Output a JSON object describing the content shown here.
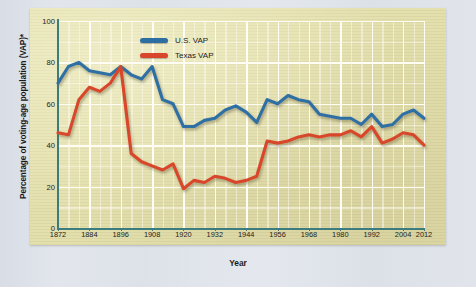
{
  "figure": {
    "panel_color": "#e3dfab",
    "background_color": "#dfe3ea",
    "axis_color": "#3d7c7c",
    "grid_color": "#fdfaf0"
  },
  "legend": {
    "position": "top-center",
    "entries": [
      {
        "label": "U.S. VAP",
        "color": "#2d6fa3"
      },
      {
        "label": "Texas VAP",
        "color": "#d9462c"
      }
    ]
  },
  "chart_data": {
    "type": "line",
    "title": "",
    "subtitle": "",
    "xlabel": "Year",
    "ylabel": "Percentage of voting-age population (VAP)*",
    "xlim": [
      1872,
      2012
    ],
    "ylim": [
      0,
      100
    ],
    "yticks": [
      0,
      20,
      40,
      60,
      80,
      100
    ],
    "xticks": [
      1872,
      1884,
      1896,
      1908,
      1920,
      1932,
      1944,
      1956,
      1968,
      1980,
      1992,
      2004,
      2012
    ],
    "grid": true,
    "x": [
      1872,
      1876,
      1880,
      1884,
      1888,
      1892,
      1896,
      1900,
      1904,
      1908,
      1912,
      1916,
      1920,
      1924,
      1928,
      1932,
      1936,
      1940,
      1944,
      1948,
      1952,
      1956,
      1960,
      1964,
      1968,
      1972,
      1976,
      1980,
      1984,
      1988,
      1992,
      1996,
      2000,
      2004,
      2008,
      2012
    ],
    "series": [
      {
        "name": "U.S. VAP",
        "color": "#2d6fa3",
        "values": [
          70,
          78,
          80,
          76,
          75,
          74,
          78,
          74,
          72,
          78,
          62,
          60,
          49,
          49,
          52,
          53,
          57,
          59,
          56,
          51,
          62,
          60,
          64,
          62,
          61,
          55,
          54,
          53,
          53,
          50,
          55,
          49,
          50,
          55,
          57,
          53
        ]
      },
      {
        "name": "Texas VAP",
        "color": "#d9462c",
        "values": [
          46,
          45,
          62,
          68,
          66,
          70,
          78,
          36,
          32,
          30,
          28,
          31,
          19,
          23,
          22,
          25,
          24,
          22,
          23,
          25,
          42,
          41,
          42,
          44,
          45,
          44,
          45,
          45,
          47,
          44,
          49,
          41,
          43,
          46,
          45,
          40
        ]
      }
    ],
    "footnote_marker": "*"
  }
}
